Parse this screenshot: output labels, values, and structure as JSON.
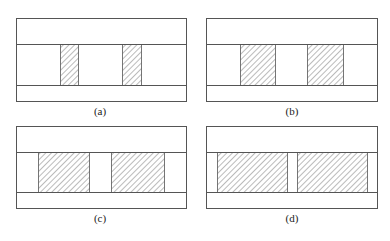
{
  "figure": {
    "line_color": "#555555",
    "hatch_color": "#555555",
    "panels": [
      {
        "id": "a",
        "caption": "(a)",
        "box": {
          "x": 16,
          "y": 18,
          "w": 170,
          "h": 83
        },
        "band": {
          "top": 44,
          "bottom": 85
        },
        "bars": [
          {
            "x": 60,
            "w": 18
          },
          {
            "x": 122,
            "w": 19
          }
        ],
        "caption_pos": {
          "cx": 100,
          "y": 105
        }
      },
      {
        "id": "b",
        "caption": "(b)",
        "box": {
          "x": 206,
          "y": 18,
          "w": 171,
          "h": 83
        },
        "band": {
          "top": 44,
          "bottom": 85
        },
        "bars": [
          {
            "x": 240,
            "w": 35
          },
          {
            "x": 307,
            "w": 36
          }
        ],
        "caption_pos": {
          "cx": 292,
          "y": 105
        }
      },
      {
        "id": "c",
        "caption": "(c)",
        "box": {
          "x": 16,
          "y": 126,
          "w": 170,
          "h": 82
        },
        "band": {
          "top": 152,
          "bottom": 192
        },
        "bars": [
          {
            "x": 38,
            "w": 51
          },
          {
            "x": 111,
            "w": 53
          }
        ],
        "caption_pos": {
          "cx": 100,
          "y": 212
        }
      },
      {
        "id": "d",
        "caption": "(d)",
        "box": {
          "x": 206,
          "y": 126,
          "w": 171,
          "h": 82
        },
        "band": {
          "top": 152,
          "bottom": 192
        },
        "bars": [
          {
            "x": 217,
            "w": 70
          },
          {
            "x": 297,
            "w": 70
          }
        ],
        "caption_pos": {
          "cx": 292,
          "y": 212
        }
      }
    ]
  }
}
